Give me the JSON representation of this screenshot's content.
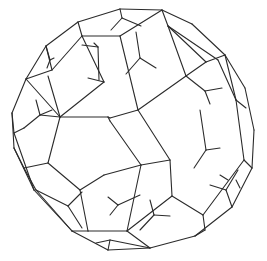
{
  "figure": {
    "stroke_color": "#2b2b2b",
    "background": "#ffffff",
    "segments": [
      [
        78,
        22,
        120,
        9
      ],
      [
        120,
        9,
        162,
        10
      ],
      [
        162,
        10,
        192,
        24
      ],
      [
        192,
        24,
        225,
        55
      ],
      [
        225,
        55,
        245,
        88
      ],
      [
        245,
        88,
        254,
        130
      ],
      [
        254,
        130,
        252,
        168
      ],
      [
        252,
        168,
        232,
        207
      ],
      [
        232,
        207,
        195,
        236
      ],
      [
        195,
        236,
        150,
        248
      ],
      [
        150,
        248,
        108,
        250
      ],
      [
        108,
        250,
        72,
        231
      ],
      [
        72,
        231,
        34,
        190
      ],
      [
        34,
        190,
        14,
        148
      ],
      [
        14,
        148,
        12,
        113
      ],
      [
        12,
        113,
        26,
        79
      ],
      [
        26,
        79,
        46,
        46
      ],
      [
        46,
        46,
        78,
        22
      ],
      [
        78,
        22,
        82,
        36
      ],
      [
        82,
        36,
        120,
        36
      ],
      [
        120,
        36,
        162,
        10
      ],
      [
        120,
        9,
        122,
        18
      ],
      [
        122,
        18,
        111,
        30
      ],
      [
        122,
        18,
        141,
        26
      ],
      [
        162,
        10,
        168,
        26
      ],
      [
        168,
        26,
        206,
        62
      ],
      [
        206,
        62,
        225,
        55
      ],
      [
        168,
        26,
        218,
        60
      ],
      [
        46,
        46,
        52,
        70
      ],
      [
        52,
        70,
        26,
        79
      ],
      [
        46,
        46,
        50,
        60
      ],
      [
        50,
        60,
        47,
        68
      ],
      [
        50,
        60,
        54,
        58
      ],
      [
        52,
        70,
        82,
        36
      ],
      [
        48,
        76,
        60,
        117
      ],
      [
        60,
        117,
        26,
        79
      ],
      [
        60,
        117,
        108,
        117
      ],
      [
        108,
        117,
        110,
        118
      ],
      [
        82,
        36,
        104,
        82
      ],
      [
        104,
        82,
        60,
        117
      ],
      [
        104,
        82,
        88,
        78
      ],
      [
        120,
        36,
        138,
        110
      ],
      [
        138,
        110,
        110,
        118
      ],
      [
        138,
        110,
        186,
        76
      ],
      [
        168,
        26,
        186,
        76
      ],
      [
        186,
        76,
        206,
        62
      ],
      [
        82,
        45,
        98,
        47
      ],
      [
        98,
        47,
        99,
        80
      ],
      [
        98,
        47,
        94,
        43
      ],
      [
        136,
        32,
        140,
        58
      ],
      [
        140,
        58,
        126,
        74
      ],
      [
        140,
        58,
        156,
        68
      ],
      [
        218,
        60,
        236,
        100
      ],
      [
        236,
        100,
        225,
        55
      ],
      [
        12,
        113,
        14,
        133
      ],
      [
        14,
        133,
        34,
        190
      ],
      [
        14,
        133,
        24,
        128
      ],
      [
        24,
        128,
        40,
        115
      ],
      [
        40,
        115,
        36,
        100
      ],
      [
        40,
        115,
        60,
        117
      ],
      [
        40,
        115,
        52,
        110
      ],
      [
        60,
        117,
        48,
        163
      ],
      [
        48,
        163,
        24,
        168
      ],
      [
        24,
        168,
        14,
        148
      ],
      [
        48,
        163,
        80,
        190
      ],
      [
        80,
        190,
        104,
        175
      ],
      [
        108,
        117,
        110,
        121
      ],
      [
        110,
        121,
        141,
        165
      ],
      [
        141,
        165,
        104,
        175
      ],
      [
        138,
        110,
        170,
        160
      ],
      [
        170,
        160,
        141,
        165
      ],
      [
        186,
        76,
        205,
        91
      ],
      [
        205,
        91,
        222,
        88
      ],
      [
        205,
        91,
        210,
        104
      ],
      [
        200,
        110,
        206,
        150
      ],
      [
        206,
        150,
        220,
        148
      ],
      [
        206,
        150,
        194,
        168
      ],
      [
        236,
        100,
        244,
        160
      ],
      [
        244,
        160,
        252,
        168
      ],
      [
        236,
        100,
        246,
        108
      ],
      [
        172,
        196,
        203,
        215
      ],
      [
        203,
        215,
        244,
        160
      ],
      [
        24,
        168,
        36,
        190
      ],
      [
        36,
        190,
        72,
        231
      ],
      [
        36,
        190,
        68,
        206
      ],
      [
        68,
        206,
        82,
        228
      ],
      [
        68,
        206,
        82,
        192
      ],
      [
        80,
        190,
        88,
        231
      ],
      [
        88,
        231,
        72,
        231
      ],
      [
        88,
        231,
        127,
        231
      ],
      [
        127,
        231,
        141,
        165
      ],
      [
        127,
        231,
        150,
        248
      ],
      [
        108,
        197,
        118,
        205
      ],
      [
        118,
        205,
        140,
        195
      ],
      [
        118,
        205,
        110,
        215
      ],
      [
        170,
        160,
        172,
        196
      ],
      [
        172,
        196,
        127,
        231
      ],
      [
        220,
        175,
        228,
        180
      ],
      [
        203,
        215,
        205,
        230
      ],
      [
        205,
        230,
        195,
        236
      ],
      [
        236,
        180,
        240,
        188
      ],
      [
        150,
        200,
        154,
        215
      ],
      [
        154,
        215,
        140,
        230
      ],
      [
        154,
        215,
        170,
        216
      ],
      [
        232,
        207,
        226,
        190
      ],
      [
        226,
        190,
        210,
        185
      ],
      [
        226,
        190,
        238,
        170
      ],
      [
        96,
        243,
        110,
        240
      ],
      [
        110,
        240,
        150,
        248
      ],
      [
        110,
        240,
        108,
        250
      ]
    ]
  }
}
